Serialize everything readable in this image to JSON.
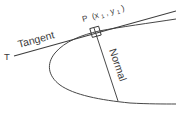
{
  "figure": {
    "kind": "geometry-diagram",
    "background_color": "#ffffff",
    "ink_color": "#3d3d3d",
    "labels": {
      "tangent": "Tangent",
      "normal": "Normal",
      "axis_point": "T",
      "point_name": "P",
      "point_coords_open": "(x",
      "point_coords_sub1": "1",
      "point_coords_mid": ", y",
      "point_coords_sub2": "1",
      "point_coords_close": ")"
    },
    "elements": {
      "curve_name": "parabola",
      "tangent_line_name": "tangent-line",
      "normal_line_name": "normal-line",
      "right_angle_name": "right-angle-marker"
    }
  }
}
